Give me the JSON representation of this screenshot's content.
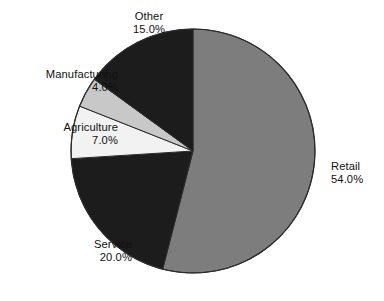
{
  "chart_data": {
    "type": "pie",
    "title": "",
    "subtitle": "",
    "xlabel": "",
    "ylabel": "",
    "legend_position": "none",
    "grid": false,
    "label_format": "name + percent",
    "start_angle_deg": 0,
    "direction": "clockwise",
    "categories": [
      "Retail",
      "Service",
      "Agriculture",
      "Manufacturing",
      "Other"
    ],
    "values": [
      54.0,
      20.0,
      7.0,
      4.0,
      15.0
    ],
    "slices": [
      {
        "name": "Retail",
        "value": 54.0,
        "percent_text": "54.0%",
        "color": "#7d7d7d",
        "start_deg": 0.0,
        "end_deg": 194.4,
        "label_align": "left"
      },
      {
        "name": "Service",
        "value": 20.0,
        "percent_text": "20.0%",
        "color": "#1c1c1c",
        "start_deg": 194.4,
        "end_deg": 266.4,
        "label_align": "right"
      },
      {
        "name": "Agriculture",
        "value": 7.0,
        "percent_text": "7.0%",
        "color": "#f2f2f2",
        "start_deg": 266.4,
        "end_deg": 291.6,
        "label_align": "right"
      },
      {
        "name": "Manufacturing",
        "value": 4.0,
        "percent_text": "4.0%",
        "color": "#c8c8c8",
        "start_deg": 291.6,
        "end_deg": 306.0,
        "label_align": "right"
      },
      {
        "name": "Other",
        "value": 15.0,
        "percent_text": "15.0%",
        "color": "#1c1c1c",
        "start_deg": 306.0,
        "end_deg": 360.0,
        "label_align": "center"
      }
    ]
  },
  "labels": {
    "retail": {
      "name": "Retail",
      "percent": "54.0%"
    },
    "service": {
      "name": "Service",
      "percent": "20.0%"
    },
    "agriculture": {
      "name": "Agriculture",
      "percent": "7.0%"
    },
    "manufacturing": {
      "name": "Manufacturing",
      "percent": "4.0%"
    },
    "other": {
      "name": "Other",
      "percent": "15.0%"
    }
  },
  "geometry": {
    "center_x": 193,
    "center_y": 151,
    "radius": 122
  },
  "colors": {
    "background": "#ffffff",
    "outline": "#2b2b2b",
    "text": "#111111"
  }
}
